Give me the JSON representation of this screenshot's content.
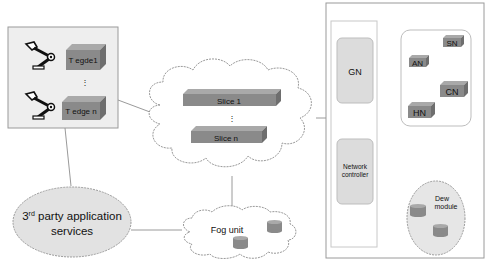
{
  "colors": {
    "box_face": "#8a8a8a",
    "box_top": "#a9a9a9",
    "box_side": "#6e6e6e",
    "panel_fill": "#eeeeee",
    "rounded_fill": "#dcdcdc",
    "ellipse_fill": "#e2e2e2",
    "line": "#9a9a9a",
    "cloud_stroke": "#9a9a9a"
  },
  "edge_panel": {
    "devices": [
      {
        "icon": "robot-arm-icon",
        "label": "T egde1"
      },
      {
        "icon": "robot-arm-icon",
        "label": "T edge n"
      }
    ],
    "ellipsis": "⋮"
  },
  "slice_cloud": {
    "slices": [
      {
        "label": "Slice 1"
      },
      {
        "label": "Slice n"
      }
    ],
    "ellipsis": "⋮"
  },
  "third_party": {
    "label_prefix": "3",
    "label_superscript": "rd",
    "label_line1_rest": " party application",
    "label_line2": "services"
  },
  "fog": {
    "label": "Fog unit",
    "storage_icons": [
      "storage-cylinder-icon",
      "storage-cylinder-icon"
    ]
  },
  "core_panel": {
    "gn_label": "GN",
    "network_controller_line1": "Network",
    "network_controller_line2": "controller",
    "nodes": [
      {
        "label": "SN"
      },
      {
        "label": "AN"
      },
      {
        "label": "CN"
      },
      {
        "label": "HN"
      }
    ],
    "dew": {
      "label_line1": "Dew",
      "label_line2": "module"
    }
  }
}
